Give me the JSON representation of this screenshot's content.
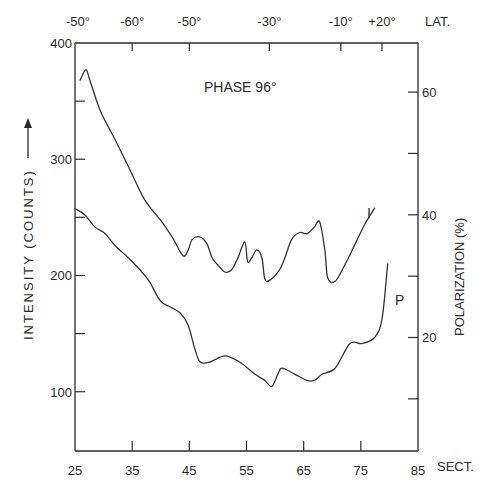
{
  "chart_data": {
    "type": "line",
    "title": "PHASE 96°",
    "xlabel": "SECT.",
    "ylabel": "INTENSITY (COUNTS)",
    "ylabel_right": "POLARIZATION (%)",
    "top_axis_label": "LAT.",
    "xlim": [
      25,
      85
    ],
    "ylim": [
      49,
      400
    ],
    "ylim_right": [
      1.5,
      68
    ],
    "grid": false,
    "legend": "inline-labels",
    "x_ticks": [
      25,
      35,
      45,
      55,
      65,
      75,
      85
    ],
    "x_tick_labels": [
      "25",
      "35",
      "45",
      "55",
      "65",
      "75",
      "85"
    ],
    "y_ticks": [
      100,
      150,
      200,
      250,
      300,
      350,
      400
    ],
    "y_tick_labels": [
      "100",
      "",
      "200",
      "",
      "300",
      "",
      "400"
    ],
    "y_right_ticks": [
      10,
      20,
      30,
      40,
      50,
      60
    ],
    "y_right_tick_labels": [
      "",
      "20",
      "",
      "40",
      "",
      "60"
    ],
    "top_ticks": [
      {
        "sect": 35,
        "label": "-60°"
      },
      {
        "sect": 45,
        "label": "-50°"
      },
      {
        "sect": 59,
        "label": "-30°"
      },
      {
        "sect": 71.5,
        "label": "-10°"
      },
      {
        "sect": 78.7,
        "label": "+20°"
      }
    ],
    "top_corner_label": "-50°",
    "series": [
      {
        "name": "I",
        "axis": "left",
        "label_at": [
          77.5,
          0
        ],
        "x": [
          25.9,
          26.9,
          27.6,
          29.4,
          32.0,
          34.6,
          37.2,
          39.9,
          42.0,
          43.9,
          44.8,
          45.5,
          46.9,
          48.1,
          49.0,
          50.0,
          51.2,
          52.4,
          53.5,
          54.7,
          55.2,
          55.9,
          56.8,
          57.7,
          58.2,
          59.1,
          60.8,
          61.7,
          62.9,
          64.3,
          65.6,
          66.9,
          67.8,
          68.7,
          69.2,
          70.5,
          72.2,
          74.0,
          75.7,
          77.4
        ],
        "values": [
          368,
          377,
          368,
          342,
          317,
          291,
          265,
          248,
          233,
          217,
          222,
          231,
          233,
          227,
          215,
          209,
          203,
          205,
          215,
          229,
          212,
          215,
          222,
          215,
          197,
          196,
          205,
          215,
          231,
          237,
          236,
          242,
          246,
          222,
          198,
          195,
          209,
          227,
          244,
          258
        ]
      },
      {
        "name": "P",
        "axis": "right",
        "x": [
          25.0,
          26.7,
          28.5,
          30.2,
          32.0,
          34.3,
          36.4,
          38.1,
          39.9,
          41.6,
          43.4,
          44.8,
          46.0,
          46.9,
          48.6,
          51.2,
          53.8,
          56.5,
          58.2,
          59.4,
          60.5,
          61.2,
          63.5,
          65.6,
          66.9,
          68.2,
          70.5,
          73.1,
          75.2,
          77.4,
          78.7,
          79.7
        ],
        "values": [
          41,
          40,
          38,
          37,
          35,
          33,
          31,
          29,
          26,
          25,
          24,
          22,
          18,
          16,
          16,
          17,
          16,
          14,
          13,
          12,
          14,
          15,
          14,
          13,
          13,
          14,
          15,
          19,
          19,
          20,
          23,
          32
        ]
      }
    ]
  },
  "labels": {
    "series_I": "I",
    "series_P": "P"
  }
}
